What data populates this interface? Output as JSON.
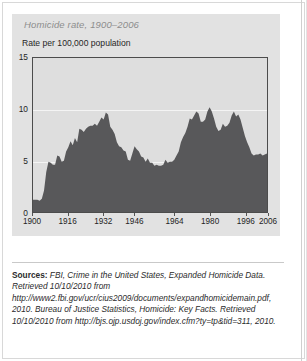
{
  "figure": {
    "title": "Homicide rate, 1900–2006",
    "y_axis_label": "Rate per 100,000 population"
  },
  "sources": {
    "label": "Sources:",
    "text": "FBI, Crime in the United States, Expanded Homicide Data. Retrieved 10/10/2010 from http://www2.fbi.gov/ucr/cius2009/documents/expandhomicidemain.pdf, 2010. Bureau of Justice Statistics, Homicide: Key Facts. Retrieved 10/10/2010 from http://bjs.ojp.usdoj.gov/index.cfm?ty=tp&tid=311, 2010."
  },
  "colors": {
    "panel_background": "#e2e2e2",
    "plot_background": "#dedede",
    "area_fill": "#58585a",
    "plot_border": "#4c4c4c",
    "gridline": "#f4f4f4",
    "title_text": "#8d8d8d",
    "body_text": "#2b2b2b"
  },
  "chart_data": {
    "type": "area",
    "title": "Homicide rate, 1900–2006",
    "xlabel": "",
    "ylabel": "Rate per 100,000 population",
    "xlim": [
      1900,
      2006
    ],
    "ylim": [
      0,
      15
    ],
    "yticks": [
      0,
      5,
      10,
      15
    ],
    "xticks": [
      1900,
      1916,
      1932,
      1946,
      1964,
      1980,
      1996,
      2006
    ],
    "grid": true,
    "legend": "none",
    "x": [
      1900,
      1901,
      1902,
      1903,
      1904,
      1905,
      1906,
      1907,
      1908,
      1909,
      1910,
      1911,
      1912,
      1913,
      1914,
      1915,
      1916,
      1917,
      1918,
      1919,
      1920,
      1921,
      1922,
      1923,
      1924,
      1925,
      1926,
      1927,
      1928,
      1929,
      1930,
      1931,
      1932,
      1933,
      1934,
      1935,
      1936,
      1937,
      1938,
      1939,
      1940,
      1941,
      1942,
      1943,
      1944,
      1945,
      1946,
      1947,
      1948,
      1949,
      1950,
      1951,
      1952,
      1953,
      1954,
      1955,
      1956,
      1957,
      1958,
      1959,
      1960,
      1961,
      1962,
      1963,
      1964,
      1965,
      1966,
      1967,
      1968,
      1969,
      1970,
      1971,
      1972,
      1973,
      1974,
      1975,
      1976,
      1977,
      1978,
      1979,
      1980,
      1981,
      1982,
      1983,
      1984,
      1985,
      1986,
      1987,
      1988,
      1989,
      1990,
      1991,
      1992,
      1993,
      1994,
      1995,
      1996,
      1997,
      1998,
      1999,
      2000,
      2001,
      2002,
      2003,
      2004,
      2005,
      2006
    ],
    "values": [
      1.2,
      1.2,
      1.2,
      1.1,
      1.3,
      2.1,
      3.9,
      4.9,
      4.8,
      4.6,
      4.6,
      5.5,
      5.4,
      4.9,
      5.0,
      5.9,
      6.3,
      6.9,
      6.5,
      7.2,
      6.8,
      8.1,
      8.0,
      7.8,
      8.1,
      8.3,
      8.4,
      8.4,
      8.6,
      8.4,
      8.8,
      9.2,
      9.0,
      9.7,
      9.5,
      8.3,
      8.0,
      7.6,
      6.8,
      6.4,
      6.3,
      6.0,
      5.9,
      5.1,
      5.0,
      5.7,
      6.4,
      6.1,
      5.9,
      5.4,
      5.3,
      4.9,
      5.2,
      4.8,
      4.8,
      4.5,
      4.6,
      4.5,
      4.5,
      4.6,
      5.1,
      4.8,
      4.9,
      4.9,
      5.1,
      5.5,
      5.9,
      6.8,
      7.3,
      7.7,
      8.3,
      9.1,
      9.0,
      9.4,
      9.8,
      9.6,
      8.8,
      8.8,
      9.0,
      9.8,
      10.2,
      9.8,
      9.1,
      8.3,
      7.9,
      8.0,
      8.6,
      8.3,
      8.4,
      8.7,
      9.4,
      9.8,
      9.3,
      9.5,
      9.0,
      8.2,
      7.4,
      6.8,
      6.3,
      5.7,
      5.5,
      5.6,
      5.6,
      5.7,
      5.5,
      5.6,
      5.7
    ]
  }
}
